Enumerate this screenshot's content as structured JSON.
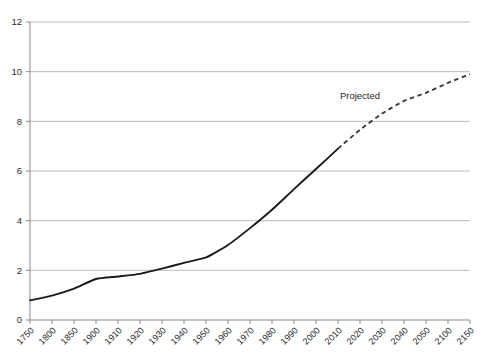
{
  "chart_data": {
    "type": "line",
    "title": "",
    "subtitle": "",
    "xlabel": "",
    "ylabel": "",
    "ylim": [
      0,
      12
    ],
    "ytick_labels": [
      "0",
      "2",
      "4",
      "6",
      "8",
      "10",
      "12"
    ],
    "ytick_values": [
      0,
      2,
      4,
      6,
      8,
      10,
      12
    ],
    "grid": "horizontal",
    "legend_position": "none",
    "categories": [
      "1750",
      "1800",
      "1850",
      "1900",
      "1910",
      "1920",
      "1930",
      "1940",
      "1950",
      "1960",
      "1970",
      "1980",
      "1990",
      "2000",
      "2010",
      "2020",
      "2030",
      "2040",
      "2050",
      "2100",
      "2150"
    ],
    "series": [
      {
        "name": "Historical",
        "style": "solid",
        "color": "#1a1a1a",
        "x": [
          "1750",
          "1800",
          "1850",
          "1900",
          "1910",
          "1920",
          "1930",
          "1940",
          "1950",
          "1960",
          "1970",
          "1980",
          "1990",
          "2000",
          "2010"
        ],
        "values": [
          0.79,
          0.98,
          1.26,
          1.65,
          1.75,
          1.86,
          2.07,
          2.3,
          2.52,
          3.02,
          3.7,
          4.44,
          5.27,
          6.08,
          6.9
        ]
      },
      {
        "name": "Projected",
        "style": "dashed",
        "color": "#3b3b3b",
        "x": [
          "2010",
          "2020",
          "2030",
          "2040",
          "2050",
          "2100",
          "2150"
        ],
        "values": [
          6.9,
          7.66,
          8.31,
          8.82,
          9.15,
          9.55,
          9.9
        ]
      }
    ],
    "annotations": [
      {
        "text": "Projected",
        "x": "2020",
        "y": 8.9
      }
    ]
  },
  "axis": {
    "y_axis_name": "population-axis",
    "x_axis_name": "year-axis"
  }
}
